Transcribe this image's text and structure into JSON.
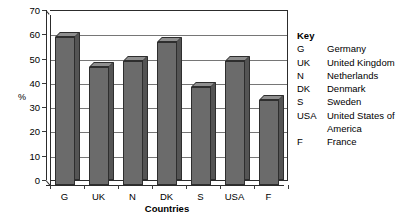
{
  "chart_data": {
    "type": "bar",
    "title": "",
    "subtitle": "",
    "xlabel": "Countries",
    "ylabel": "%",
    "categories": [
      "G",
      "UK",
      "N",
      "DK",
      "S",
      "USA",
      "F"
    ],
    "values": [
      61,
      48.5,
      51,
      59,
      40.5,
      51,
      35
    ],
    "series": [
      {
        "name": "",
        "values": [
          61,
          48.5,
          51,
          59,
          40.5,
          51,
          35
        ]
      }
    ],
    "ylim": [
      0,
      70
    ],
    "ytick_step": 10,
    "yticks": [
      70,
      60,
      50,
      40,
      30,
      20,
      10,
      0
    ],
    "ytick_labels": [
      "70",
      "60",
      "50",
      "40",
      "30",
      "20",
      "10",
      "0"
    ],
    "grid": "horizontal",
    "legend_position": "right",
    "bar_style": "3d",
    "colors": {
      "bar_front": "#6b6b6b",
      "bar_side": "#545454",
      "bar_top": "#8f8f8f",
      "bar_outline": "#2e2e2e",
      "gridline": "#767676",
      "axis": "#2c2c2c",
      "background": "#ffffff",
      "text": "#000000"
    }
  },
  "legend": {
    "title": "Key",
    "entries": [
      {
        "abbr": "G",
        "name": "Germany"
      },
      {
        "abbr": "UK",
        "name": "United Kingdom"
      },
      {
        "abbr": "N",
        "name": "Netherlands"
      },
      {
        "abbr": "DK",
        "name": "Denmark"
      },
      {
        "abbr": "S",
        "name": "Sweden"
      },
      {
        "abbr": "USA",
        "name": "United States of America"
      },
      {
        "abbr": "F",
        "name": "France"
      }
    ]
  }
}
